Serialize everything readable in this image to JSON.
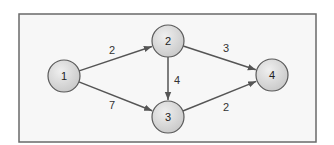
{
  "diagram": {
    "type": "directed-weighted-graph",
    "nodes": [
      {
        "id": "1",
        "label": "1"
      },
      {
        "id": "2",
        "label": "2"
      },
      {
        "id": "3",
        "label": "3"
      },
      {
        "id": "4",
        "label": "4"
      }
    ],
    "edges": [
      {
        "from": "1",
        "to": "2",
        "weight": "2"
      },
      {
        "from": "1",
        "to": "3",
        "weight": "7"
      },
      {
        "from": "2",
        "to": "3",
        "weight": "4"
      },
      {
        "from": "2",
        "to": "4",
        "weight": "3"
      },
      {
        "from": "3",
        "to": "4",
        "weight": "2"
      }
    ],
    "colors": {
      "node_fill": "#d9d9d9",
      "node_stroke": "#5a5a5a",
      "edge": "#555555",
      "background": "#f7f7f7"
    }
  }
}
